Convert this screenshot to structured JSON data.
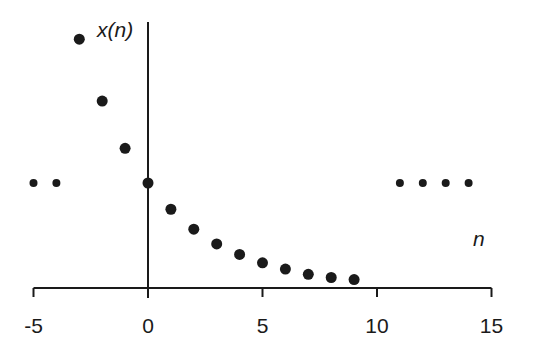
{
  "chart_data": {
    "type": "scatter",
    "title": "",
    "xlabel": "n",
    "ylabel": "x(n)",
    "xlim": [
      -5,
      15
    ],
    "x_ticks": [
      -5,
      0,
      5,
      10,
      15
    ],
    "x_tick_labels": [
      "-5",
      "0",
      "5",
      "10",
      "15"
    ],
    "y_ticks": [],
    "grid": false,
    "legend": null,
    "series": [
      {
        "name": "x(n)",
        "style": "large-dot",
        "x": [
          -3,
          -2,
          -1,
          0,
          1,
          2,
          3,
          4,
          5,
          6,
          7,
          8,
          9
        ],
        "y": [
          2.37,
          1.78,
          1.33,
          1.0,
          0.75,
          0.56,
          0.42,
          0.32,
          0.24,
          0.18,
          0.13,
          0.1,
          0.08
        ]
      }
    ],
    "annotations": [
      {
        "type": "ellipsis-dots",
        "x": [
          -5,
          -4
        ],
        "y": 1.0,
        "meaning": "continuation left"
      },
      {
        "type": "ellipsis-dots",
        "x": [
          11,
          12,
          13,
          14
        ],
        "y": 1.0,
        "meaning": "continuation right"
      }
    ]
  },
  "labels": {
    "ylabel": "x(n)",
    "xlabel": "n"
  },
  "colors": {
    "ink": "#1a1a1a",
    "background": "#ffffff"
  },
  "layout": {
    "x0_px": 148,
    "px_per_unit": 22.9,
    "baseline_px": 288,
    "unit_height_px": 105,
    "yaxis_top_px": 22
  }
}
